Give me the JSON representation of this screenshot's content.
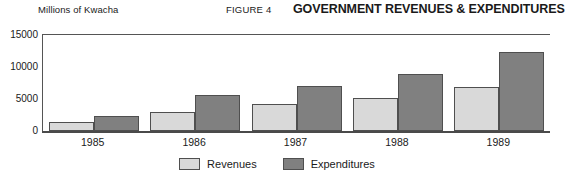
{
  "header": {
    "unit_label": "Millions of Kwacha",
    "figure_number": "FIGURE 4",
    "title": "GOVERNMENT REVENUES & EXPENDITURES"
  },
  "colors": {
    "revenues": "#d9d9d9",
    "expenditures": "#808080",
    "outline": "#4f4f4f",
    "axis": "#555555"
  },
  "legend": [
    {
      "label": "Revenues",
      "color": "#d9d9d9"
    },
    {
      "label": "Expenditures",
      "color": "#808080"
    }
  ],
  "chart_data": {
    "type": "bar",
    "title": "GOVERNMENT REVENUES & EXPENDITURES",
    "subtitle": "FIGURE 4",
    "xlabel": "",
    "ylabel": "Millions of Kwacha",
    "categories": [
      "1985",
      "1986",
      "1987",
      "1988",
      "1989"
    ],
    "series": [
      {
        "name": "Revenues",
        "color": "#d9d9d9",
        "values": [
          1450,
          2950,
          4250,
          5200,
          6800
        ]
      },
      {
        "name": "Expenditures",
        "color": "#808080",
        "values": [
          2300,
          5600,
          7050,
          8900,
          12400
        ]
      }
    ],
    "ylim": [
      0,
      15000
    ],
    "yticks": [
      0,
      5000,
      10000,
      15000
    ],
    "ytick_labels": [
      "0",
      "5000",
      "10000",
      "15000"
    ],
    "grid": false,
    "legend_position": "bottom-center"
  }
}
